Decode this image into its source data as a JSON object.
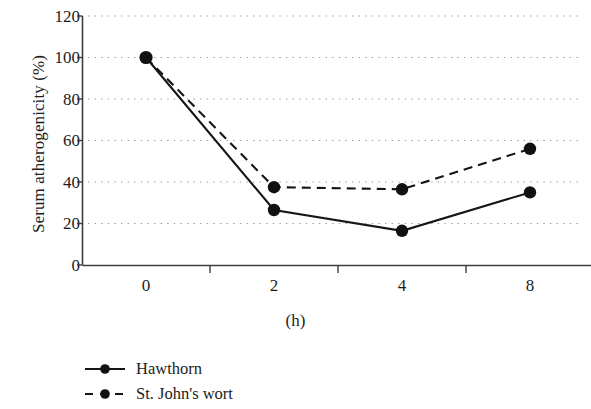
{
  "chart_data": {
    "type": "line",
    "title": "",
    "xlabel": "(h)",
    "ylabel": "Serum atherogenicity (%)",
    "categories": [
      "0",
      "2",
      "4",
      "8"
    ],
    "x_tick_labels": [
      "0",
      "2",
      "4",
      "8"
    ],
    "y_tick_labels": [
      "0",
      "20",
      "40",
      "60",
      "80",
      "100",
      "120"
    ],
    "y_ticks": [
      0,
      20,
      40,
      60,
      80,
      100,
      120
    ],
    "ylim": [
      0,
      120
    ],
    "grid": "horizontal dotted",
    "legend_position": "below-left",
    "series": [
      {
        "name": "Hawthorn",
        "line_style": "solid",
        "marker": "filled-circle",
        "color": "#1a1a1a",
        "values": [
          100,
          26.5,
          16.5,
          35
        ]
      },
      {
        "name": "St. John's wort",
        "line_style": "dashed",
        "marker": "filled-circle",
        "color": "#1a1a1a",
        "values": [
          100,
          37.5,
          36.5,
          56
        ]
      }
    ]
  },
  "axes": {
    "y_label": "Serum atherogenicity (%)",
    "x_label": "(h)",
    "y_ticks": [
      "120",
      "100",
      "80",
      "60",
      "40",
      "20",
      "0"
    ],
    "x_ticks": [
      "0",
      "2",
      "4",
      "8"
    ]
  },
  "legend": {
    "items": [
      {
        "label": "Hawthorn",
        "style": "solid"
      },
      {
        "label": "St. John's wort",
        "style": "dashed"
      }
    ]
  },
  "colors": {
    "line": "#1a1a1a",
    "grid": "#9b9b9b",
    "axis": "#4a4a4a",
    "background": "#ffffff"
  }
}
